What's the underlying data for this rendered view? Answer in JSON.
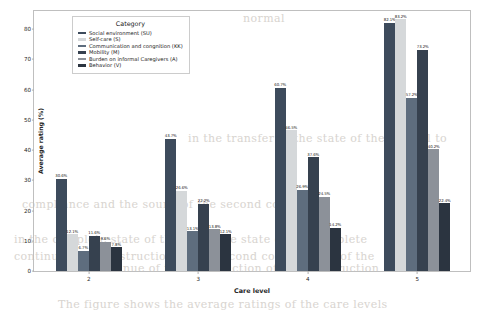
{
  "figure": {
    "background_color": "#ffffff",
    "frame_color": "#bfbfbf"
  },
  "legend": {
    "title": "Category",
    "position": "upper-left-inside",
    "entries": [
      {
        "label": "Social environment (SU)",
        "color": "#3d4b5c"
      },
      {
        "label": "Self-care (S)",
        "color": "#d5d8da"
      },
      {
        "label": "Communication and congnition (KK)",
        "color": "#5e6d7e"
      },
      {
        "label": "Mobility (M)",
        "color": "#36414f"
      },
      {
        "label": "Burden on informal Caregivers (A)",
        "color": "#8c9199"
      },
      {
        "label": "Behavior (V)",
        "color": "#2b3440"
      }
    ]
  },
  "chart_data": {
    "type": "bar",
    "title": "",
    "xlabel": "Care level",
    "ylabel": "Average rating (%)",
    "categories": [
      "2",
      "3",
      "4",
      "5"
    ],
    "ylim": [
      0,
      86
    ],
    "yticks": [
      0,
      10,
      20,
      30,
      40,
      50,
      60,
      70,
      80
    ],
    "ytick_labels": [
      "0",
      "10",
      "20",
      "30",
      "40",
      "50",
      "60",
      "70",
      "80"
    ],
    "xtick_labels": [
      "2",
      "3",
      "4",
      "5"
    ],
    "grid": false,
    "value_label_suffix": "%",
    "series": [
      {
        "name": "Social environment (SU)",
        "color": "#3d4b5c",
        "values": [
          30.6,
          43.7,
          60.7,
          82.1
        ],
        "labels": [
          "30.6%",
          "43.7%",
          "60.7%",
          "82.1%"
        ]
      },
      {
        "name": "Self-care (S)",
        "color": "#d5d8da",
        "values": [
          12.1,
          26.6,
          46.5,
          83.2
        ],
        "labels": [
          "12.1%",
          "26.6%",
          "46.5%",
          "83.2%"
        ]
      },
      {
        "name": "Communication and congnition (KK)",
        "color": "#5e6d7e",
        "values": [
          6.7,
          13.1,
          26.9,
          57.2
        ],
        "labels": [
          "6.7%",
          "13.1%",
          "26.9%",
          "57.2%"
        ]
      },
      {
        "name": "Mobility (M)",
        "color": "#36414f",
        "values": [
          11.6,
          22.2,
          37.6,
          73.2
        ],
        "labels": [
          "11.6%",
          "22.2%",
          "37.6%",
          "73.2%"
        ]
      },
      {
        "name": "Burden on informal Caregivers (A)",
        "color": "#8c9199",
        "values": [
          9.6,
          13.8,
          24.5,
          40.2
        ],
        "labels": [
          "9.6%",
          "13.8%",
          "24.5%",
          "40.2%"
        ]
      },
      {
        "name": "Behavior (V)",
        "color": "#2b3440",
        "values": [
          7.8,
          12.1,
          14.2,
          22.4
        ],
        "labels": [
          "7.8%",
          "12.1%",
          "14.2%",
          "22.4%"
        ]
      }
    ]
  },
  "background_text": [
    {
      "text": "normal",
      "x": 243,
      "y": 12
    },
    {
      "text": "in the transfer of the state of the control to",
      "x": 188,
      "y": 132
    },
    {
      "text": "compliance and the sound of the second control",
      "x": 22,
      "y": 198
    },
    {
      "text": "in the complete state of the complete state of the complete",
      "x": 14,
      "y": 233
    },
    {
      "text": "continues the construction of the second construction of the",
      "x": 14,
      "y": 250
    },
    {
      "text": "the continue of the construction of the construction",
      "x": 70,
      "y": 262
    },
    {
      "text": "The figure shows the average ratings of the care levels",
      "x": 58,
      "y": 298
    }
  ]
}
